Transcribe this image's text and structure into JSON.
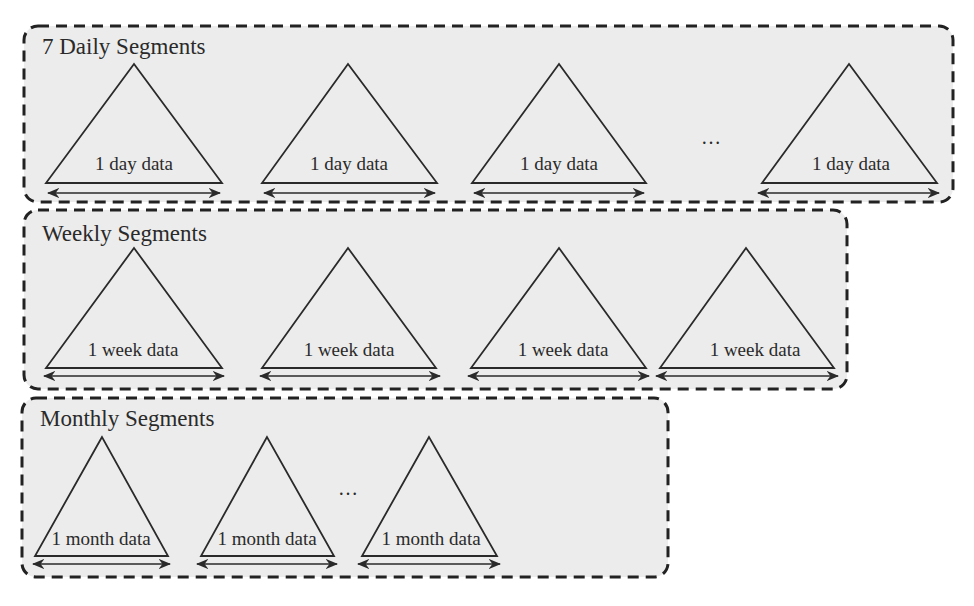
{
  "diagram": {
    "colors": {
      "panel_fill": "#ececec",
      "border": "#222222",
      "line": "#2a2a2a",
      "text": "#2a2a2a"
    },
    "segments": [
      {
        "title": "7 Daily Segments",
        "items": [
          "1 day data",
          "1 day data",
          "1 day data",
          "1 day data"
        ],
        "ellipsis": "…",
        "ellipsis_position": "between item 3 and item 4"
      },
      {
        "title": "Weekly Segments",
        "items": [
          "1 week data",
          "1 week data",
          "1 week data",
          "1 week data"
        ]
      },
      {
        "title": "Monthly Segments",
        "items": [
          "1 month data",
          "1 month data",
          "1 month data"
        ],
        "ellipsis": "…",
        "ellipsis_position": "between item 2 and item 3"
      }
    ]
  }
}
